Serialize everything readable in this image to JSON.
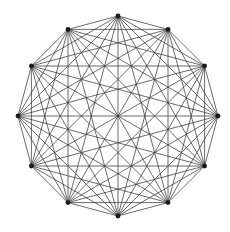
{
  "figure": {
    "background_color": "#ffffff"
  },
  "chart_data": {
    "type": "scatter",
    "title": "",
    "subtitle": "",
    "xlabel": "",
    "ylabel": "",
    "grid": false,
    "legend_position": "none",
    "axis_visible": false,
    "tick_labels": [],
    "annotations": [],
    "graph": {
      "name": "K12",
      "vertex_count": 12,
      "edge_count": 66,
      "layout": "circular",
      "complete": true,
      "center": {
        "x": 118,
        "y": 116
      },
      "radius": 100,
      "start_angle_deg": -90,
      "vertex_radius_px": 2.4,
      "edge_color": "#3a3a3a",
      "vertex_color": "#1a1a1a",
      "edge_width": 0.75,
      "vertices": [
        {
          "id": 0,
          "angle_deg": -90,
          "x": 118.0,
          "y": 16.0
        },
        {
          "id": 1,
          "angle_deg": -60,
          "x": 168.0,
          "y": 29.4
        },
        {
          "id": 2,
          "angle_deg": -30,
          "x": 204.6,
          "y": 66.0
        },
        {
          "id": 3,
          "angle_deg": 0,
          "x": 218.0,
          "y": 116.0
        },
        {
          "id": 4,
          "angle_deg": 30,
          "x": 204.6,
          "y": 166.0
        },
        {
          "id": 5,
          "angle_deg": 60,
          "x": 168.0,
          "y": 202.6
        },
        {
          "id": 6,
          "angle_deg": 90,
          "x": 118.0,
          "y": 216.0
        },
        {
          "id": 7,
          "angle_deg": 120,
          "x": 68.0,
          "y": 202.6
        },
        {
          "id": 8,
          "angle_deg": 150,
          "x": 31.4,
          "y": 166.0
        },
        {
          "id": 9,
          "angle_deg": 180,
          "x": 18.0,
          "y": 116.0
        },
        {
          "id": 10,
          "angle_deg": 210,
          "x": 31.4,
          "y": 66.0
        },
        {
          "id": 11,
          "angle_deg": 240,
          "x": 68.0,
          "y": 29.4
        }
      ]
    }
  }
}
